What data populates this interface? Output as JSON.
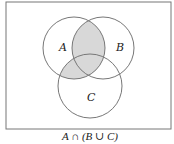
{
  "diagram": {
    "type": "venn",
    "caption": "A ∩ (B ∪ C)",
    "colors": {
      "stroke": "#777777",
      "shade": "#d8d8d8",
      "background": "#ffffff"
    },
    "universe": {
      "x": 6,
      "y": 2,
      "width": 165,
      "height": 127
    },
    "sets": [
      {
        "id": "A",
        "label": "A",
        "cx": 74,
        "cy": 48,
        "r": 31,
        "label_x": 59,
        "label_y": 51
      },
      {
        "id": "B",
        "label": "B",
        "cx": 103,
        "cy": 48,
        "r": 31,
        "label_x": 116,
        "label_y": 51
      },
      {
        "id": "C",
        "label": "C",
        "cx": 90,
        "cy": 86,
        "r": 32,
        "label_x": 88,
        "label_y": 101
      }
    ],
    "shaded_region": "A ∩ (B ∪ C)"
  }
}
